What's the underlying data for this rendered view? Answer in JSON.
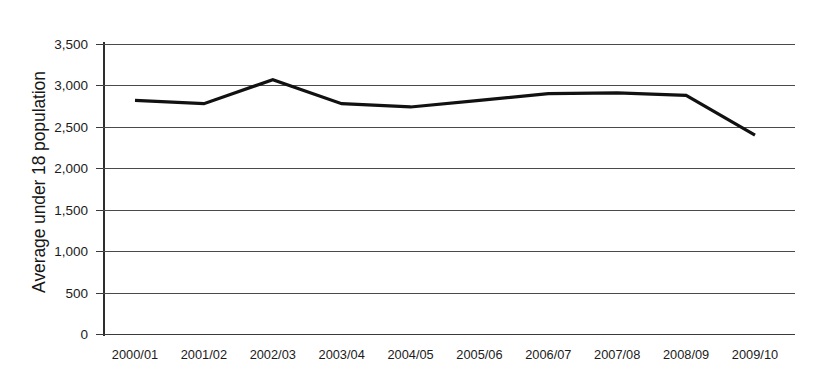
{
  "chart_data": {
    "type": "line",
    "title": "",
    "subtitle": "",
    "xlabel": "",
    "ylabel": "Average under 18 population",
    "categories": [
      "2000/01",
      "2001/02",
      "2002/03",
      "2003/04",
      "2004/05",
      "2005/06",
      "2006/07",
      "2007/08",
      "2008/09",
      "2009/10"
    ],
    "values": [
      2820,
      2780,
      3070,
      2780,
      2740,
      2820,
      2900,
      2910,
      2880,
      2400
    ],
    "series": [
      {
        "name": "Average under 18 population",
        "values": [
          2820,
          2780,
          3070,
          2780,
          2740,
          2820,
          2900,
          2910,
          2880,
          2400
        ]
      }
    ],
    "ylim": [
      0,
      3500
    ],
    "ytick_values": [
      0,
      500,
      1000,
      1500,
      2000,
      2500,
      3000,
      3500
    ],
    "ytick_labels": [
      "0",
      "500",
      "1,000",
      "1,500",
      "2,000",
      "2,500",
      "3,000",
      "3,500"
    ],
    "grid": true,
    "grid_axis": "y",
    "legend": false,
    "legend_position": "none",
    "line_color": "#111111",
    "grid_color": "#4a4a4a",
    "axis_color": "#2e2e2e",
    "background_color": "#ffffff",
    "markers": false
  }
}
